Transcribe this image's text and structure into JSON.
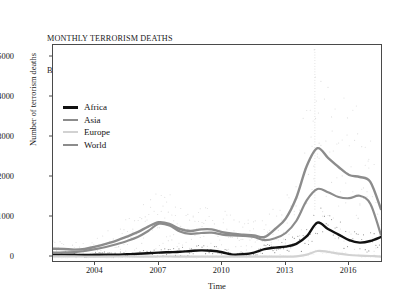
{
  "chart_data": {
    "type": "line",
    "title": "MONTHLY TERRORISM DEATHS BY CONTINENT (2002-2017)",
    "title_line1": "MONTHLY TERRORISM DEATHS",
    "title_line2": "BY CONTINENT (2002-2017)",
    "xlabel": "Time",
    "ylabel": "Number of terrorism deaths",
    "xlim": [
      2002.0,
      2017.6
    ],
    "ylim": [
      -150,
      5300
    ],
    "xticks": [
      2004,
      2007,
      2010,
      2013,
      2016
    ],
    "xtick_labels": [
      "2004",
      "2007",
      "2010",
      "2013",
      "2016"
    ],
    "yticks": [
      0,
      1000,
      2000,
      3000,
      4000,
      5000
    ],
    "ytick_labels": [
      "0",
      "1000",
      "2000",
      "3000",
      "4000",
      "5000"
    ],
    "grid": false,
    "legend_position": "upper left",
    "overlay": "faint dotted monthly scatter points behind each smoothed trend line",
    "x": [
      2002.0,
      2002.5,
      2003.0,
      2003.5,
      2004.0,
      2004.5,
      2005.0,
      2005.5,
      2006.0,
      2006.5,
      2007.0,
      2007.5,
      2008.0,
      2008.5,
      2009.0,
      2009.5,
      2010.0,
      2010.5,
      2011.0,
      2011.5,
      2012.0,
      2012.5,
      2013.0,
      2013.5,
      2014.0,
      2014.5,
      2015.0,
      2015.5,
      2016.0,
      2016.5,
      2017.0,
      2017.5
    ],
    "series": [
      {
        "name": "Africa",
        "color": "#111111",
        "width": 2.4,
        "values": [
          60,
          60,
          55,
          50,
          55,
          60,
          60,
          70,
          80,
          95,
          110,
          120,
          130,
          150,
          165,
          155,
          120,
          60,
          70,
          110,
          195,
          235,
          260,
          330,
          520,
          860,
          700,
          560,
          420,
          360,
          400,
          500
        ]
      },
      {
        "name": "Asia",
        "color": "#8c8c8c",
        "width": 2.2,
        "values": [
          110,
          115,
          120,
          150,
          195,
          250,
          320,
          400,
          500,
          650,
          830,
          790,
          640,
          580,
          600,
          610,
          560,
          540,
          530,
          500,
          420,
          470,
          600,
          900,
          1420,
          1700,
          1620,
          1500,
          1470,
          1530,
          1330,
          560
        ]
      },
      {
        "name": "Europe",
        "color": "#d2d2d2",
        "width": 2.2,
        "values": [
          18,
          15,
          14,
          12,
          10,
          10,
          12,
          12,
          10,
          10,
          12,
          12,
          10,
          8,
          8,
          8,
          8,
          8,
          8,
          8,
          8,
          8,
          10,
          18,
          60,
          150,
          130,
          85,
          50,
          35,
          25,
          10
        ]
      },
      {
        "name": "World",
        "color": "#8c8c8c",
        "width": 2.4,
        "values": [
          205,
          200,
          185,
          200,
          260,
          330,
          410,
          510,
          620,
          760,
          870,
          830,
          700,
          650,
          690,
          690,
          620,
          580,
          560,
          540,
          500,
          700,
          960,
          1480,
          2280,
          2720,
          2480,
          2250,
          2050,
          2000,
          1880,
          1200
        ]
      }
    ],
    "scatter_note": "monthly observations, World scatter reaches ~5200 near 2014.5"
  },
  "legend": {
    "items": [
      {
        "label": "Africa",
        "color": "#111111",
        "thickness": "3px"
      },
      {
        "label": "Asia",
        "color": "#8c8c8c",
        "thickness": "2px"
      },
      {
        "label": "Europe",
        "color": "#d2d2d2",
        "thickness": "2px"
      },
      {
        "label": "World",
        "color": "#8c8c8c",
        "thickness": "2.5px"
      }
    ]
  },
  "colors": {
    "axis": "#4a4a4a",
    "text": "#1a1a1a",
    "background": "#ffffff",
    "africa": "#111111",
    "asia": "#8c8c8c",
    "europe": "#d2d2d2",
    "world": "#8c8c8c"
  }
}
